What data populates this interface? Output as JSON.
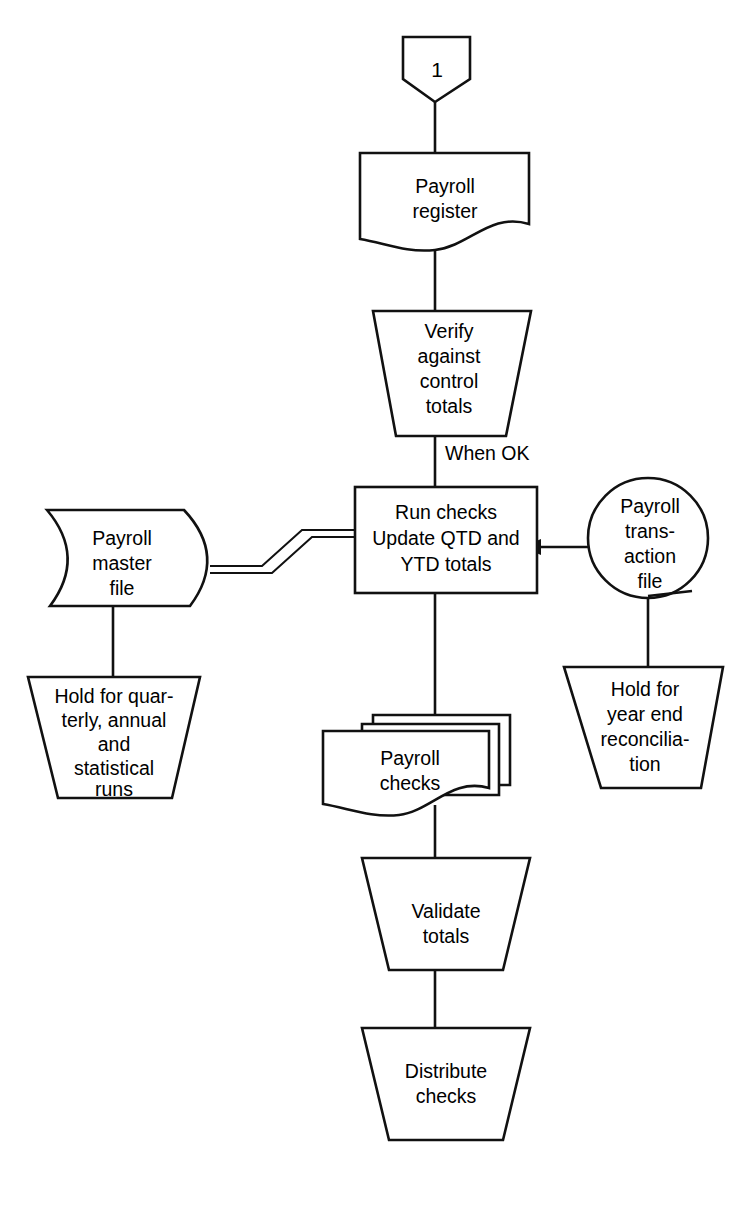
{
  "diagram": {
    "background_color": "#ffffff",
    "line_color": "#111111"
  },
  "nodes": {
    "connector_start": {
      "shape": "off-page-connector",
      "label": "1"
    },
    "payroll_register": {
      "shape": "document",
      "line1": "Payroll",
      "line2": "register"
    },
    "verify_totals": {
      "shape": "manual-operation-trapezoid",
      "line1": "Verify",
      "line2": "against",
      "line3": "control",
      "line4": "totals"
    },
    "run_checks": {
      "shape": "process-rectangle",
      "line1": "Run checks",
      "line2": "Update QTD and",
      "line3": "YTD totals"
    },
    "payroll_master_file": {
      "shape": "magnetic-tape",
      "line1": "Payroll",
      "line2": "master",
      "line3": "file"
    },
    "payroll_transaction_file": {
      "shape": "online-storage-circle",
      "line1": "Payroll",
      "line2": "trans-",
      "line3": "action",
      "line4": "file"
    },
    "hold_quarterly": {
      "shape": "manual-operation-trapezoid",
      "line1": "Hold for quar-",
      "line2": "terly, annual",
      "line3": "and",
      "line4": "statistical",
      "line5": "runs"
    },
    "hold_year_end": {
      "shape": "manual-operation-trapezoid",
      "line1": "Hold for",
      "line2": "year end",
      "line3": "reconcilia-",
      "line4": "tion"
    },
    "payroll_checks": {
      "shape": "multi-document",
      "line1": "Payroll",
      "line2": "checks"
    },
    "validate_totals": {
      "shape": "manual-operation-trapezoid",
      "line1": "Validate",
      "line2": "totals"
    },
    "distribute_checks": {
      "shape": "manual-operation-trapezoid",
      "line1": "Distribute",
      "line2": "checks"
    }
  },
  "edges": {
    "when_ok": {
      "label": "When OK",
      "from": "verify_totals",
      "to": "run_checks"
    },
    "connector_to_register": {
      "label": "",
      "from": "connector_start",
      "to": "payroll_register"
    },
    "register_to_verify": {
      "label": "",
      "from": "payroll_register",
      "to": "verify_totals"
    },
    "master_to_run": {
      "label": "",
      "from": "payroll_master_file",
      "to": "run_checks"
    },
    "transaction_to_run": {
      "label": "",
      "from": "payroll_transaction_file",
      "to": "run_checks"
    },
    "master_to_hold": {
      "label": "",
      "from": "payroll_master_file",
      "to": "hold_quarterly"
    },
    "transaction_to_hold": {
      "label": "",
      "from": "payroll_transaction_file",
      "to": "hold_year_end"
    },
    "run_to_checks": {
      "label": "",
      "from": "run_checks",
      "to": "payroll_checks"
    },
    "checks_to_validate": {
      "label": "",
      "from": "payroll_checks",
      "to": "validate_totals"
    },
    "validate_to_distribute": {
      "label": "",
      "from": "validate_totals",
      "to": "distribute_checks"
    }
  }
}
